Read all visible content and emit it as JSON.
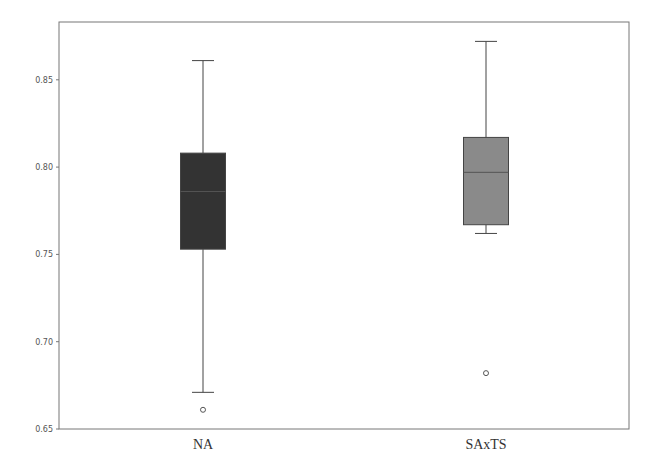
{
  "chart_data": {
    "type": "box",
    "title": "",
    "xlabel": "",
    "ylabel": "",
    "ylim": [
      0.65,
      0.883
    ],
    "yticks": [
      "0.65",
      "0.70",
      "0.75",
      "0.80",
      "0.85"
    ],
    "grid": false,
    "legend": null,
    "categories": [
      "NA",
      "SAxTS"
    ],
    "series": [
      {
        "name": "NA",
        "whisker_high": 0.861,
        "q3": 0.808,
        "median": 0.786,
        "q1": 0.753,
        "whisker_low": 0.671,
        "outliers": [
          0.661
        ],
        "color": "#333333"
      },
      {
        "name": "SAxTS",
        "whisker_high": 0.872,
        "q3": 0.817,
        "median": 0.797,
        "q1": 0.767,
        "whisker_low": 0.762,
        "outliers": [
          0.682
        ],
        "color": "#8a8a8a"
      }
    ]
  }
}
